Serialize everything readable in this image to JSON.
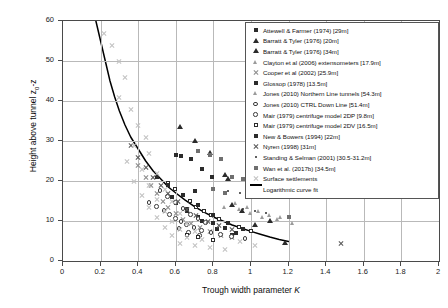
{
  "axes": {
    "xlabel_text": "Trough width parameter ",
    "xlabel_symbol": "K",
    "ylabel_prefix": "Height above tunnel z",
    "ylabel_sub": "0",
    "ylabel_suffix": "-z",
    "xticks": [
      "0",
      "0.2",
      "0.4",
      "0.6",
      "0.8",
      "1",
      "1.2",
      "1.4",
      "1.6",
      "1.8",
      "2"
    ],
    "yticks": [
      "0",
      "10",
      "20",
      "30",
      "40",
      "50",
      "60"
    ]
  },
  "legend": {
    "entries": [
      {
        "label": "Attewell & Farmer (1974) [29m]",
        "marker": "square-filled"
      },
      {
        "label": "Barratt & Tyler (1976) [20m]",
        "marker": "triangle-filled"
      },
      {
        "label": "Barratt & Tyler (1976) [34m]",
        "marker": "triangle-filled"
      },
      {
        "label": "Clayton et al (2006) extensometers [17.9m]",
        "marker": "triangle-gray"
      },
      {
        "label": "Cooper et al (2002) [25.9m]",
        "marker": "cross-gray"
      },
      {
        "label": "Glossop (1978) [13.5m]",
        "marker": "square-filled"
      },
      {
        "label": "Jones (2010) Northern Line tunnels [54.3m]",
        "marker": "triangle-gray"
      },
      {
        "label": "Jones (2010) CTRL Down Line [51.4m]",
        "marker": "circle-open"
      },
      {
        "label": "Mair (1979) centrifuge model 2DP [9.8m]",
        "marker": "circle-open"
      },
      {
        "label": "Mair (1979) centrifuge model 2DV [16.5m]",
        "marker": "square-open"
      },
      {
        "label": "New & Bowers (1994) [22m]",
        "marker": "square-filled"
      },
      {
        "label": "Nyren (1998) [31m]",
        "marker": "cross-dark"
      },
      {
        "label": "Standing & Selman (2001) [30.5-31.2m]",
        "marker": "dot"
      },
      {
        "label": "Wan et al. (2017b) [34.5m]",
        "marker": "square-gray"
      },
      {
        "label": "Surface settlements",
        "marker": "cross-light"
      },
      {
        "label": "Logarithmic curve fit",
        "marker": "line"
      }
    ]
  },
  "chart_data": {
    "type": "scatter",
    "title": "",
    "xlabel": "Trough width parameter K",
    "ylabel": "Height above tunnel z0-z",
    "xlim": [
      0,
      2
    ],
    "ylim": [
      0,
      60
    ],
    "grid": true,
    "legend_position": "upper-right",
    "series": [
      {
        "name": "Attewell & Farmer (1974) [29m]",
        "marker": "square-filled",
        "points": [
          [
            0.6,
            26.5
          ],
          [
            0.63,
            26.2
          ],
          [
            0.68,
            25.5
          ],
          [
            0.74,
            23.0
          ],
          [
            0.79,
            21.0
          ],
          [
            0.7,
            17.5
          ],
          [
            0.6,
            14.5
          ],
          [
            0.66,
            12.5
          ],
          [
            0.72,
            11.0
          ],
          [
            0.8,
            9.5
          ],
          [
            0.86,
            8.2
          ],
          [
            0.92,
            7.0
          ]
        ]
      },
      {
        "name": "Barratt & Tyler (1976) [20m]",
        "marker": "triangle-filled",
        "points": [
          [
            0.78,
            27.0
          ],
          [
            0.86,
            21.5
          ],
          [
            0.9,
            14.0
          ],
          [
            0.95,
            12.5
          ],
          [
            1.02,
            9.0
          ],
          [
            1.18,
            4.5
          ]
        ]
      },
      {
        "name": "Barratt & Tyler (1976) [34m]",
        "marker": "triangle-filled",
        "points": [
          [
            0.62,
            33.5
          ],
          [
            0.7,
            30.0
          ],
          [
            0.88,
            20.5
          ],
          [
            1.1,
            10.0
          ]
        ]
      },
      {
        "name": "Clayton et al (2006) extensometers [17.9m]",
        "marker": "triangle-gray",
        "points": [
          [
            0.86,
            13.5
          ],
          [
            0.94,
            12.8
          ],
          [
            1.0,
            12.0
          ],
          [
            1.06,
            11.0
          ],
          [
            1.14,
            10.5
          ],
          [
            1.22,
            9.5
          ]
        ]
      },
      {
        "name": "Cooper et al (2002) [25.9m]",
        "marker": "cross-gray",
        "points": [
          [
            0.4,
            24.0
          ],
          [
            0.44,
            21.0
          ],
          [
            0.47,
            19.0
          ],
          [
            0.5,
            17.0
          ],
          [
            0.53,
            15.0
          ],
          [
            0.56,
            13.5
          ],
          [
            0.6,
            12.0
          ],
          [
            0.64,
            10.5
          ],
          [
            0.68,
            9.5
          ],
          [
            0.73,
            8.5
          ],
          [
            0.78,
            7.5
          ],
          [
            0.84,
            6.5
          ],
          [
            0.9,
            6.0
          ]
        ]
      },
      {
        "name": "Glossop (1978) [13.5m]",
        "marker": "square-filled",
        "points": [
          [
            0.58,
            16.0
          ],
          [
            0.66,
            13.0
          ],
          [
            0.74,
            10.0
          ],
          [
            0.82,
            8.0
          ],
          [
            0.9,
            6.5
          ]
        ]
      },
      {
        "name": "Jones (2010) Northern Line tunnels [54.3m]",
        "marker": "triangle-gray",
        "points": [
          [
            0.92,
            14.5
          ],
          [
            0.98,
            13.5
          ],
          [
            1.04,
            12.5
          ],
          [
            1.1,
            11.5
          ],
          [
            1.16,
            11.0
          ]
        ]
      },
      {
        "name": "Jones (2010) CTRL Down Line [51.4m]",
        "marker": "circle-open",
        "points": [
          [
            0.46,
            14.5
          ],
          [
            0.5,
            13.5
          ],
          [
            0.54,
            12.5
          ],
          [
            0.57,
            11.5
          ],
          [
            0.6,
            10.5
          ],
          [
            0.63,
            9.8
          ],
          [
            0.66,
            9.0
          ],
          [
            0.7,
            8.2
          ],
          [
            0.74,
            7.5
          ],
          [
            0.79,
            7.0
          ],
          [
            0.84,
            6.5
          ],
          [
            0.9,
            6.0
          ],
          [
            0.97,
            5.5
          ]
        ]
      },
      {
        "name": "Mair (1979) centrifuge model 2DP [9.8m]",
        "marker": "circle-open",
        "points": [
          [
            0.52,
            17.5
          ],
          [
            0.56,
            16.0
          ],
          [
            0.6,
            14.5
          ],
          [
            0.64,
            13.0
          ],
          [
            0.68,
            11.5
          ],
          [
            0.72,
            10.5
          ],
          [
            0.76,
            9.5
          ],
          [
            0.62,
            8.0
          ],
          [
            0.67,
            7.0
          ],
          [
            0.73,
            6.2
          ]
        ]
      },
      {
        "name": "Mair (1979) centrifuge model 2DV [16.5m]",
        "marker": "square-open",
        "points": [
          [
            0.56,
            19.5
          ],
          [
            0.6,
            18.0
          ],
          [
            0.64,
            16.5
          ],
          [
            0.68,
            15.0
          ],
          [
            0.71,
            13.5
          ],
          [
            0.75,
            12.5
          ],
          [
            0.79,
            11.5
          ],
          [
            0.83,
            10.5
          ],
          [
            0.88,
            9.5
          ],
          [
            0.94,
            8.5
          ],
          [
            1.0,
            7.5
          ],
          [
            0.66,
            6.5
          ],
          [
            0.72,
            5.8
          ],
          [
            0.8,
            5.2
          ]
        ]
      },
      {
        "name": "New & Bowers (1994) [22m]",
        "marker": "square-filled",
        "points": [
          [
            0.5,
            21.0
          ],
          [
            0.56,
            19.0
          ],
          [
            0.64,
            16.5
          ],
          [
            0.72,
            14.0
          ],
          [
            0.8,
            11.5
          ],
          [
            0.88,
            9.5
          ],
          [
            0.96,
            8.0
          ]
        ]
      },
      {
        "name": "Nyren (1998) [31m]",
        "marker": "cross-dark",
        "points": [
          [
            0.36,
            29.0
          ],
          [
            0.4,
            26.0
          ],
          [
            0.44,
            23.5
          ],
          [
            0.48,
            21.0
          ],
          [
            0.52,
            19.0
          ],
          [
            0.56,
            17.0
          ],
          [
            0.61,
            15.0
          ],
          [
            0.66,
            13.0
          ],
          [
            0.71,
            11.5
          ],
          [
            0.77,
            10.0
          ],
          [
            0.83,
            9.0
          ],
          [
            0.9,
            8.0
          ],
          [
            1.48,
            4.5
          ]
        ]
      },
      {
        "name": "Standing & Selman (2001) [30.5-31.2m]",
        "marker": "dot",
        "points": [
          [
            0.88,
            17.5
          ],
          [
            0.94,
            17.0
          ],
          [
            1.0,
            16.5
          ],
          [
            1.06,
            16.0
          ],
          [
            0.96,
            13.0
          ],
          [
            1.02,
            12.5
          ],
          [
            1.08,
            12.0
          ]
        ]
      },
      {
        "name": "Wan et al. (2017b) [34.5m]",
        "marker": "square-gray",
        "points": [
          [
            0.72,
            27.5
          ],
          [
            0.78,
            26.5
          ],
          [
            0.84,
            25.5
          ],
          [
            0.9,
            21.0
          ],
          [
            0.96,
            20.5
          ],
          [
            1.04,
            19.5
          ],
          [
            0.8,
            18.0
          ],
          [
            0.86,
            17.0
          ],
          [
            1.12,
            16.5
          ],
          [
            1.2,
            11.0
          ]
        ]
      },
      {
        "name": "Surface settlements",
        "marker": "cross-light",
        "points": [
          [
            0.22,
            57.0
          ],
          [
            0.26,
            54.0
          ],
          [
            0.3,
            50.0
          ],
          [
            0.33,
            46.0
          ],
          [
            0.3,
            41.0
          ],
          [
            0.36,
            38.0
          ],
          [
            0.4,
            34.0
          ],
          [
            0.44,
            31.0
          ],
          [
            0.38,
            29.0
          ],
          [
            0.46,
            27.0
          ],
          [
            0.34,
            25.0
          ],
          [
            0.42,
            23.0
          ],
          [
            0.5,
            22.0
          ],
          [
            0.38,
            20.0
          ],
          [
            0.46,
            19.0
          ],
          [
            0.54,
            18.0
          ],
          [
            0.42,
            16.5
          ],
          [
            0.5,
            15.5
          ],
          [
            0.58,
            15.0
          ],
          [
            0.46,
            13.5
          ],
          [
            0.54,
            12.5
          ],
          [
            0.62,
            12.0
          ],
          [
            0.5,
            11.0
          ],
          [
            0.58,
            10.0
          ],
          [
            0.66,
            9.5
          ],
          [
            0.54,
            8.5
          ],
          [
            0.62,
            8.0
          ],
          [
            0.7,
            7.5
          ],
          [
            0.58,
            6.5
          ],
          [
            0.66,
            6.0
          ],
          [
            0.74,
            5.5
          ],
          [
            0.62,
            4.5
          ],
          [
            0.7,
            4.0
          ],
          [
            0.78,
            3.5
          ],
          [
            0.86,
            3.0
          ],
          [
            0.94,
            5.0
          ],
          [
            1.02,
            4.0
          ]
        ]
      }
    ],
    "fit": {
      "name": "Logarithmic curve fit",
      "points": [
        [
          0.175,
          60
        ],
        [
          0.2,
          55
        ],
        [
          0.225,
          50
        ],
        [
          0.25,
          45
        ],
        [
          0.275,
          41
        ],
        [
          0.3,
          37.5
        ],
        [
          0.33,
          34
        ],
        [
          0.36,
          31
        ],
        [
          0.4,
          28
        ],
        [
          0.44,
          25
        ],
        [
          0.48,
          22.5
        ],
        [
          0.52,
          20.5
        ],
        [
          0.56,
          18.5
        ],
        [
          0.6,
          17
        ],
        [
          0.65,
          15.2
        ],
        [
          0.7,
          13.6
        ],
        [
          0.75,
          12.2
        ],
        [
          0.8,
          11
        ],
        [
          0.85,
          10
        ],
        [
          0.9,
          9
        ],
        [
          0.95,
          8.2
        ],
        [
          1.0,
          7.4
        ],
        [
          1.05,
          6.7
        ],
        [
          1.1,
          6.0
        ],
        [
          1.15,
          5.4
        ],
        [
          1.2,
          4.9
        ]
      ]
    }
  }
}
